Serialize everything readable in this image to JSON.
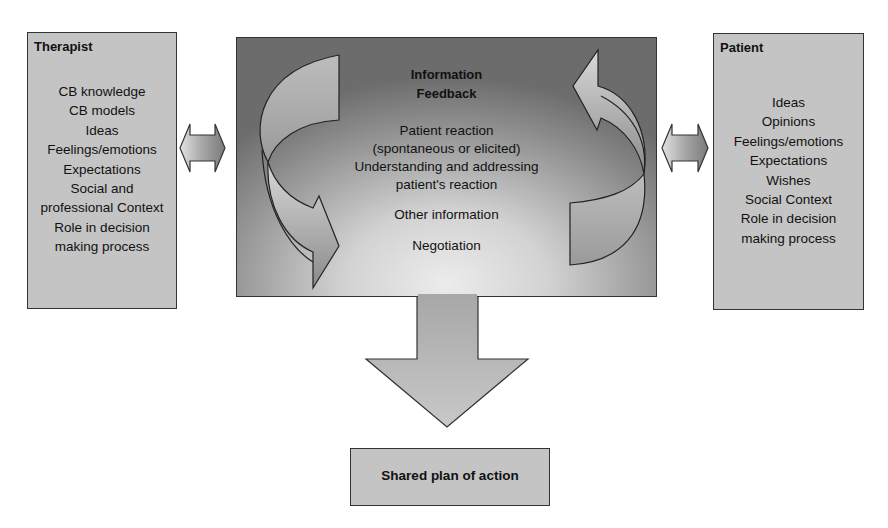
{
  "therapist": {
    "title": "Therapist",
    "items": [
      "CB knowledge",
      "CB models",
      "Ideas",
      "Feelings/emotions",
      "Expectations",
      "Social and",
      "professional Context",
      "Role in decision",
      "making process"
    ]
  },
  "patient": {
    "title": "Patient",
    "items": [
      "Ideas",
      "Opinions",
      "Feelings/emotions",
      "Expectations",
      "Wishes",
      "Social Context",
      "Role in decision",
      "making process"
    ]
  },
  "center": {
    "title_line1": "Information",
    "title_line2": "Feedback",
    "lines": [
      "Patient reaction",
      "(spontaneous or elicited)",
      "Understanding and addressing",
      "patient's reaction"
    ],
    "other": "Other information",
    "negotiation": "Negotiation"
  },
  "outcome": {
    "label": "Shared plan of action"
  },
  "colors": {
    "box_fill": "#c4c4c4",
    "border": "#333333",
    "arrow_fill": "#b8b8b8"
  }
}
